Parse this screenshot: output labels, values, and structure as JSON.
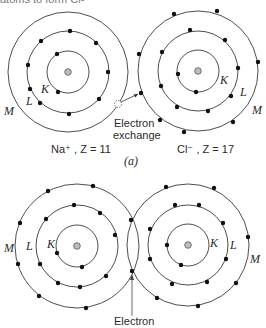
{
  "header": {
    "clipped_text": "atoms to form Cl-"
  },
  "panel_a": {
    "label": "(a)",
    "exchange_label_line1": "Electron",
    "exchange_label_line2": "exchange",
    "atoms": [
      {
        "name": "sodium",
        "ion_label": "Na⁺ , Z = 11",
        "shells": {
          "K": 2,
          "L": 8,
          "M": 0
        },
        "shell_labels": [
          "K",
          "L",
          "M"
        ]
      },
      {
        "name": "chlorine",
        "ion_label": "Cl⁻ , Z = 17",
        "shells": {
          "K": 2,
          "L": 8,
          "M": 8
        },
        "shell_labels": [
          "K",
          "L",
          "M"
        ]
      }
    ]
  },
  "panel_b": {
    "shared_label": "Electron",
    "atoms": [
      {
        "name": "left-atom",
        "shells": {
          "K": 2,
          "L": 8,
          "M": 8
        },
        "shell_labels": [
          "M",
          "L",
          "K"
        ]
      },
      {
        "name": "right-atom",
        "shells": {
          "K": 2,
          "L": 8,
          "M": 8
        },
        "shell_labels": [
          "K",
          "L",
          "M"
        ]
      }
    ]
  },
  "colors": {
    "line": "#3a3a3a",
    "electron": "#111111",
    "nucleus_fill": "#bdbdbd"
  }
}
